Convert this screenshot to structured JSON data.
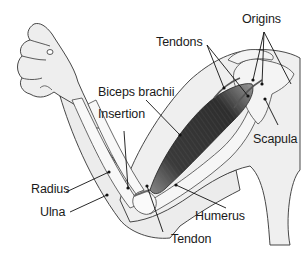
{
  "diagram": {
    "labels": {
      "tendons": "Tendons",
      "origins": "Origins",
      "biceps": "Biceps brachii",
      "insertion": "Insertion",
      "scapula": "Scapula",
      "radius": "Radius",
      "ulna": "Ulna",
      "humerus": "Humerus",
      "tendon": "Tendon"
    },
    "colors": {
      "background": "#ffffff",
      "skin_fill": "#eeeeee",
      "bone_fill": "#f7f7f7",
      "outline": "#333333",
      "muscle_dark": "#3a3a3a",
      "leader_line": "#111111"
    }
  }
}
